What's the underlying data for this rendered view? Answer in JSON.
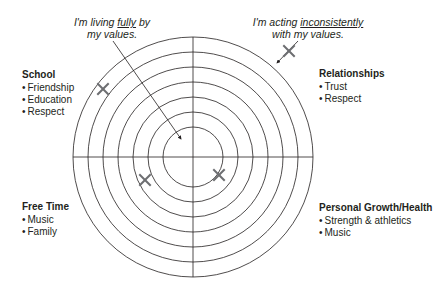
{
  "wheel": {
    "center": [
      193,
      157
    ],
    "ring_radii": [
      30,
      45,
      60,
      75,
      90,
      105,
      120
    ],
    "line_color": "#231f20",
    "mark_color": "#6d6e71"
  },
  "annotations": {
    "inner": {
      "line1_pre": "I'm living ",
      "line1_emph": "fully",
      "line1_post": " by",
      "line2": "my values."
    },
    "outer": {
      "line1_pre": "I'm acting ",
      "line1_emph": "inconsistently",
      "line2": "with my values."
    }
  },
  "categories": {
    "school": {
      "title": "School",
      "items": [
        "Friendship",
        "Education",
        "Respect"
      ],
      "mark": [
        103,
        89
      ]
    },
    "relationships": {
      "title": "Relationships",
      "items": [
        "Trust",
        "Respect"
      ],
      "mark": [
        289,
        51
      ]
    },
    "free_time": {
      "title": "Free Time",
      "items": [
        "Music",
        "Family"
      ],
      "mark": [
        145,
        180
      ]
    },
    "personal_growth": {
      "title": "Personal Growth/Health",
      "items": [
        "Strength & athletics",
        "Music"
      ],
      "mark": [
        219,
        175
      ]
    }
  }
}
